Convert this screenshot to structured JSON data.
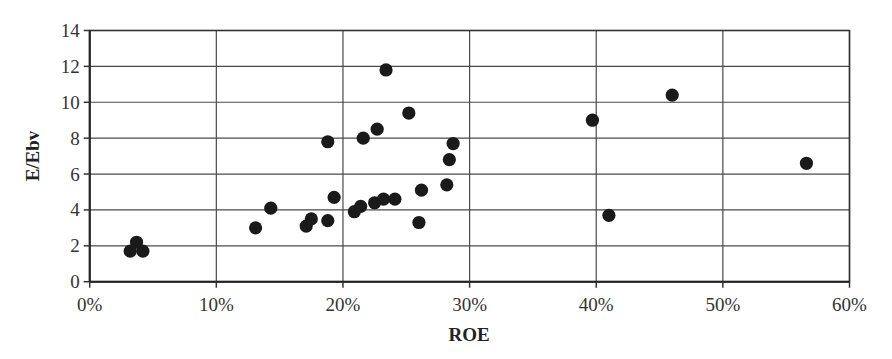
{
  "chart_data": {
    "type": "scatter",
    "title": "",
    "xlabel": "ROE",
    "ylabel": "E/Ebv",
    "xlim": [
      0,
      60
    ],
    "ylim": [
      0,
      14
    ],
    "x_ticks": [
      "0%",
      "10%",
      "20%",
      "30%",
      "40%",
      "50%",
      "60%"
    ],
    "x_tick_values": [
      0,
      10,
      20,
      30,
      40,
      50,
      60
    ],
    "y_ticks": [
      "0",
      "2",
      "4",
      "6",
      "8",
      "10",
      "12",
      "14"
    ],
    "y_tick_values": [
      0,
      2,
      4,
      6,
      8,
      10,
      12,
      14
    ],
    "grid": true,
    "legend": null,
    "marker_color": "#1a1a1a",
    "series": [
      {
        "name": "Companies",
        "points": [
          {
            "x": 3.2,
            "y": 1.7
          },
          {
            "x": 3.7,
            "y": 2.2
          },
          {
            "x": 4.2,
            "y": 1.7
          },
          {
            "x": 13.1,
            "y": 3.0
          },
          {
            "x": 14.3,
            "y": 4.1
          },
          {
            "x": 17.1,
            "y": 3.1
          },
          {
            "x": 17.5,
            "y": 3.5
          },
          {
            "x": 18.8,
            "y": 3.4
          },
          {
            "x": 18.8,
            "y": 7.8
          },
          {
            "x": 19.3,
            "y": 4.7
          },
          {
            "x": 20.9,
            "y": 3.9
          },
          {
            "x": 21.4,
            "y": 4.2
          },
          {
            "x": 21.6,
            "y": 8.0
          },
          {
            "x": 22.5,
            "y": 4.4
          },
          {
            "x": 22.7,
            "y": 8.5
          },
          {
            "x": 23.2,
            "y": 4.6
          },
          {
            "x": 23.4,
            "y": 11.8
          },
          {
            "x": 24.1,
            "y": 4.6
          },
          {
            "x": 25.2,
            "y": 9.4
          },
          {
            "x": 26.0,
            "y": 3.3
          },
          {
            "x": 26.2,
            "y": 5.1
          },
          {
            "x": 28.2,
            "y": 5.4
          },
          {
            "x": 28.4,
            "y": 6.8
          },
          {
            "x": 28.7,
            "y": 7.7
          },
          {
            "x": 39.7,
            "y": 9.0
          },
          {
            "x": 41.0,
            "y": 3.7
          },
          {
            "x": 46.0,
            "y": 10.4
          },
          {
            "x": 56.6,
            "y": 6.6
          }
        ]
      }
    ]
  }
}
